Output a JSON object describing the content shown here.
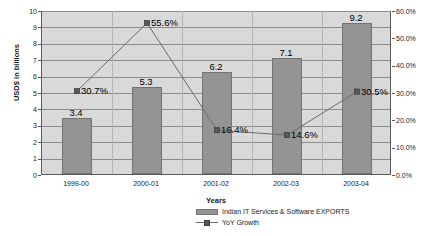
{
  "chart_data": {
    "type": "bar",
    "title": "",
    "subtitle": "",
    "xlabel": "Years",
    "ylabel": "USD$ in billions",
    "y2label": "",
    "categories": [
      "1999-00",
      "2000-01",
      "2001-02",
      "2002-03",
      "2003-04"
    ],
    "series": [
      {
        "name": "Indian IT Services & Software EXPORTS",
        "type": "bar",
        "axis": "left",
        "unit": "USD$ billions",
        "values": [
          3.4,
          5.3,
          6.2,
          7.1,
          9.2
        ],
        "data_labels": [
          "3.4",
          "5.3",
          "6.2",
          "7.1",
          "9.2"
        ],
        "color": "#949494"
      },
      {
        "name": "YoY Growth",
        "type": "line",
        "axis": "right",
        "unit": "percent",
        "values": [
          30.7,
          55.6,
          16.4,
          14.6,
          30.5
        ],
        "data_labels": [
          "30.7%",
          "55.6%",
          "16.4%",
          "14.6%",
          "30.5%"
        ],
        "color": "#6b6b6b",
        "marker": "square"
      }
    ],
    "ylim": [
      0,
      10
    ],
    "ystep": 1,
    "ytick_labels": [
      "10",
      "9",
      "8",
      "7",
      "6",
      "5",
      "4",
      "3",
      "2",
      "1",
      "0"
    ],
    "y2lim": [
      0,
      60
    ],
    "y2step": 10,
    "y2tick_labels": [
      "60.0%",
      "50.0%",
      "40.0%",
      "30.0%",
      "20.0%",
      "10.0%",
      "0.0%"
    ],
    "grid": true,
    "legend_position": "bottom-right",
    "plot_background": "#d9d9d9",
    "axis_color": "#595959",
    "gridline_color": "#8c8c8c"
  },
  "legend": {
    "items": [
      {
        "label": "Indian IT Services & Software EXPORTS",
        "marker": "bar-swatch-icon"
      },
      {
        "label": "YoY Growth",
        "marker": "line-marker-icon"
      }
    ]
  }
}
